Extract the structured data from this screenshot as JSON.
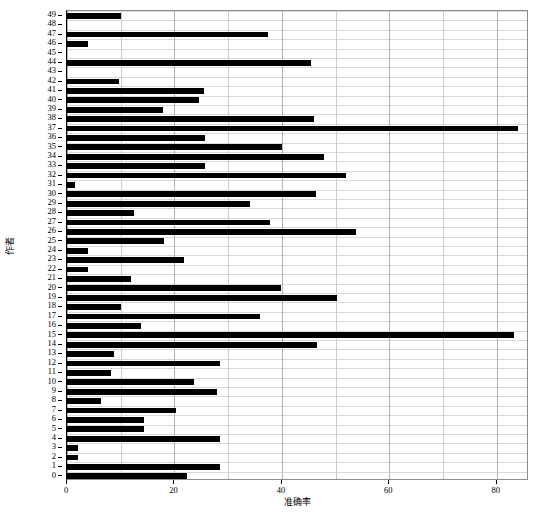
{
  "chart_data": {
    "type": "bar",
    "orientation": "horizontal",
    "title": "",
    "xlabel": "准确率",
    "ylabel": "作者",
    "xlim": [
      0,
      86
    ],
    "xticks": [
      0,
      20,
      40,
      60,
      80
    ],
    "xtick_labels": [
      "0",
      "20",
      "40",
      "60",
      "80"
    ],
    "grid": true,
    "grid_axis": "both",
    "legend": "none",
    "bar_color": "#000000",
    "categories": [
      "0",
      "1",
      "2",
      "3",
      "4",
      "5",
      "6",
      "7",
      "8",
      "9",
      "10",
      "11",
      "12",
      "13",
      "14",
      "15",
      "16",
      "17",
      "18",
      "19",
      "20",
      "21",
      "22",
      "23",
      "24",
      "25",
      "26",
      "27",
      "28",
      "29",
      "30",
      "31",
      "32",
      "33",
      "34",
      "35",
      "36",
      "37",
      "38",
      "39",
      "40",
      "41",
      "42",
      "43",
      "44",
      "45",
      "46",
      "47",
      "48",
      "49"
    ],
    "values": [
      22.4,
      28.4,
      2.1,
      2.0,
      28.4,
      14.3,
      14.3,
      20.2,
      6.3,
      28.0,
      23.7,
      8.2,
      28.5,
      8.7,
      46.5,
      83.2,
      13.7,
      36.0,
      10.0,
      50.3,
      39.9,
      12.0,
      3.9,
      21.8,
      3.9,
      18.0,
      53.8,
      37.8,
      12.4,
      34.0,
      46.3,
      1.5,
      52.0,
      25.6,
      47.8,
      40.0,
      25.6,
      84.0,
      46.0,
      17.8,
      24.6,
      25.5,
      9.7,
      0.0,
      45.4,
      0.0,
      4.0,
      37.4,
      0.0,
      10.0
    ]
  },
  "axes": {
    "ylabel_text": "作者",
    "xlabel_text": "准确率"
  }
}
